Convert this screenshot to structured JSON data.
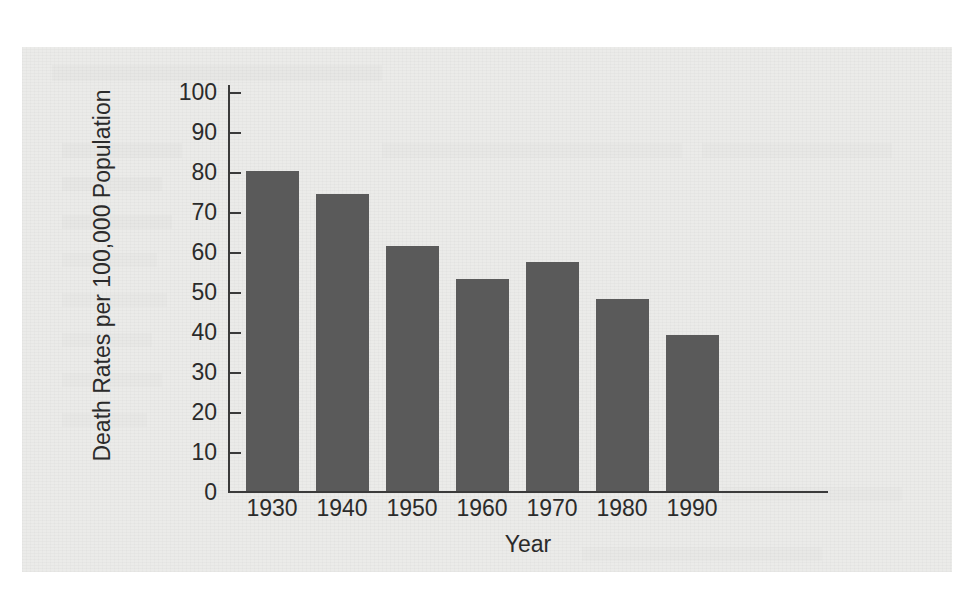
{
  "chart_data": {
    "type": "bar",
    "title": "",
    "xlabel": "Year",
    "ylabel": "Death Rates per 100,000 Population",
    "categories": [
      "1930",
      "1940",
      "1950",
      "1960",
      "1970",
      "1980",
      "1990"
    ],
    "values": [
      80.1,
      74.3,
      61.3,
      53.1,
      57.3,
      47.9,
      38.9
    ],
    "ylim": [
      0,
      100
    ],
    "ytick_labels": [
      "100",
      "90",
      "80",
      "70",
      "60",
      "50",
      "40",
      "30",
      "20",
      "10",
      "0"
    ],
    "ytick_values": [
      100,
      90,
      80,
      70,
      60,
      50,
      40,
      30,
      20,
      10,
      0
    ],
    "grid": false,
    "legend": false,
    "bar_color": "#5a5a5a",
    "axis_color": "#3a3a3a",
    "panel_background": "#ebebe9"
  }
}
